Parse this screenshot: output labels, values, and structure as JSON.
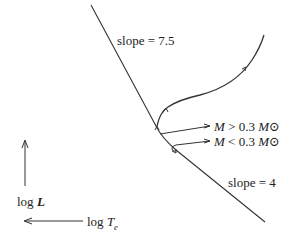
{
  "diagram": {
    "type": "HR diagram sketch of pre-main-sequence tracks",
    "labels": {
      "upper_slope": "slope = 7.5",
      "lower_slope": "slope = 4",
      "mass_high_prefix": "M",
      "mass_high_rel": " > 0.3 ",
      "mass_high_unit": "M⊙",
      "mass_low_prefix": "M",
      "mass_low_rel": " < 0.3 ",
      "mass_low_unit": "M⊙",
      "y_axis_prefix": "log ",
      "y_axis_var": "L",
      "x_axis_prefix": "log ",
      "x_axis_var": "T",
      "x_axis_sub": "e"
    },
    "colors": {
      "line": "#333333",
      "text": "#222222",
      "background": "#ffffff"
    }
  }
}
